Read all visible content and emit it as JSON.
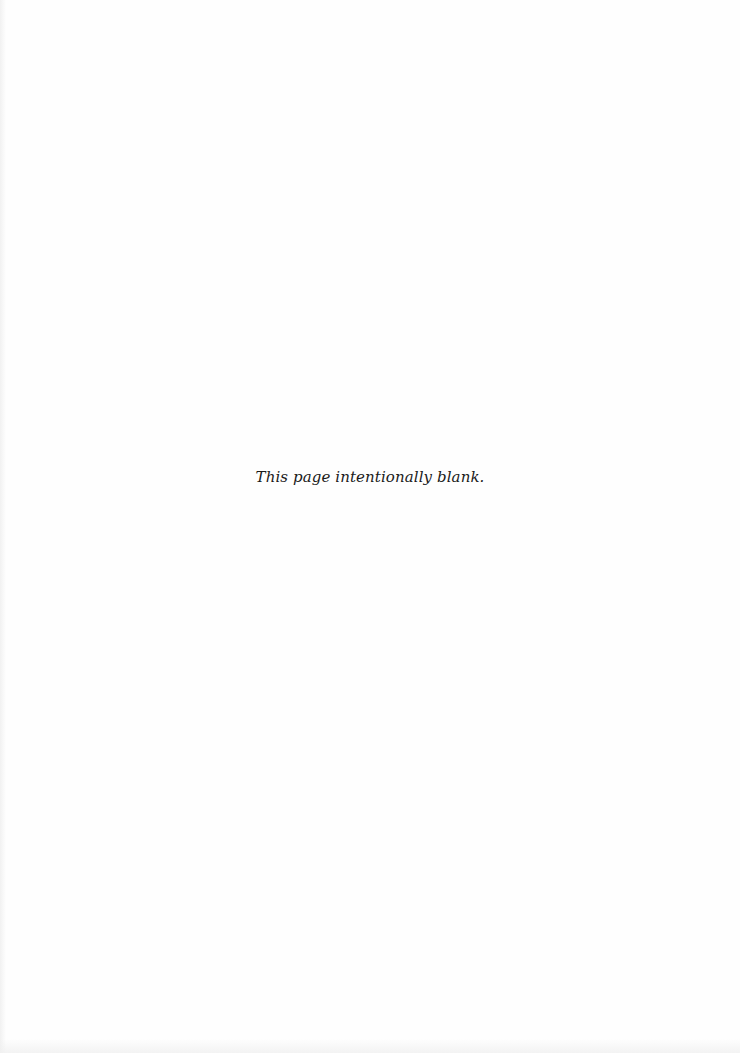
{
  "page": {
    "notice": "This page intentionally blank."
  }
}
